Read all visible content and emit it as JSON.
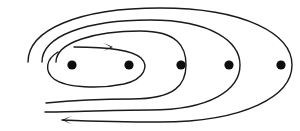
{
  "figure": {
    "background_color": "#ffffff",
    "stroke_color": "#1a1a1a",
    "dot_color": "#0d0d0d",
    "width": 300,
    "height": 131
  },
  "chart_data": {
    "type": "scatter",
    "xlabel": "",
    "ylabel": "",
    "xlim": [
      0,
      300
    ],
    "ylim": [
      0,
      131
    ],
    "grid": false,
    "legend": "none",
    "categories": [
      "pole-1",
      "pole-2",
      "pole-3",
      "pole-4",
      "pole-5"
    ],
    "series": [
      {
        "name": "poles",
        "marker": "filled-circle",
        "marker_radius": 4.6,
        "values": [
          {
            "label": "pole-1",
            "x": 72,
            "y": 65
          },
          {
            "label": "pole-2",
            "x": 129,
            "y": 65
          },
          {
            "label": "pole-3",
            "x": 181,
            "y": 65
          },
          {
            "label": "pole-4",
            "x": 229,
            "y": 65
          },
          {
            "label": "pole-5",
            "x": 281,
            "y": 65
          }
        ]
      }
    ],
    "annotations": [
      {
        "name": "inner-arrow",
        "direction": "right",
        "tip_x": 113,
        "tip_y": 47,
        "description": "arrowhead pointing right on innermost loop"
      },
      {
        "name": "outer-arrow",
        "direction": "left",
        "tip_x": 62,
        "tip_y": 120,
        "description": "arrowhead pointing left on outermost loop"
      }
    ],
    "contours": [
      {
        "name": "inner-loop",
        "cx": 96,
        "cy": 65,
        "rx": 49,
        "ry": 21
      },
      {
        "name": "middle-loop",
        "cx": 120,
        "cy": 65,
        "rx": 64,
        "ry": 36
      },
      {
        "name": "outer-loop",
        "cx": 140,
        "cy": 65,
        "rx": 98,
        "ry": 47
      },
      {
        "name": "outermost-loop",
        "cx": 160,
        "cy": 65,
        "rx": 132,
        "ry": 57
      }
    ]
  },
  "accessibility": {
    "alt_text": "Line drawing of a spiral made of four nested oval loops with five solid black dots arranged horizontally across them; an arrowhead on the innermost loop points right and an arrowhead on the outermost loop points left."
  }
}
